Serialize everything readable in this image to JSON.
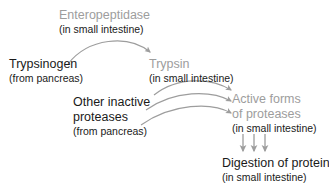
{
  "diagram": {
    "colors": {
      "text_black": "#1a1a1a",
      "text_gray": "#9d9d9d",
      "arrow_gray": "#9d9d9d",
      "background": "#ffffff"
    },
    "nodes": {
      "enteropeptidase": {
        "label": "Enteropeptidase",
        "sublabel": "(in small intestine)",
        "label_color": "gray",
        "sublabel_color": "black"
      },
      "trypsinogen": {
        "label": "Trypsinogen",
        "sublabel": "(from pancreas)",
        "label_color": "black",
        "sublabel_color": "black"
      },
      "trypsin": {
        "label": "Trypsin",
        "sublabel": "(in small intestine)",
        "label_color": "gray",
        "sublabel_color": "black"
      },
      "other_inactive_proteases": {
        "label_line1": "Other inactive",
        "label_line2": "proteases",
        "sublabel": "(from pancreas)",
        "label_color": "black",
        "sublabel_color": "black"
      },
      "active_forms": {
        "label_line1": "Active forms",
        "label_line2": "of proteases",
        "sublabel": "(in small intestine)",
        "label_color": "gray",
        "sublabel_color": "black"
      },
      "digestion": {
        "label": "Digestion of protein",
        "sublabel": "(in small intestine)",
        "label_color": "black",
        "sublabel_color": "black"
      }
    },
    "arrows": [
      {
        "name": "trypsinogen-to-trypsin",
        "from": "trypsinogen",
        "to": "trypsin",
        "catalyst": "enteropeptidase",
        "style": "curved-arc-up"
      },
      {
        "name": "trypsin-to-active-forms",
        "from": "trypsin",
        "to": "active_forms",
        "style": "curved-arc-up"
      },
      {
        "name": "other-proteases-to-active-forms-upper",
        "from": "other_inactive_proteases",
        "to": "active_forms",
        "style": "curved-arc-up"
      },
      {
        "name": "other-proteases-to-active-forms-lower",
        "from": "other_inactive_proteases",
        "to": "active_forms",
        "style": "curved-arc-up"
      },
      {
        "name": "active-forms-to-digestion-1",
        "from": "active_forms",
        "to": "digestion",
        "style": "straight-down"
      },
      {
        "name": "active-forms-to-digestion-2",
        "from": "active_forms",
        "to": "digestion",
        "style": "straight-down"
      },
      {
        "name": "active-forms-to-digestion-3",
        "from": "active_forms",
        "to": "digestion",
        "style": "straight-down"
      }
    ]
  }
}
